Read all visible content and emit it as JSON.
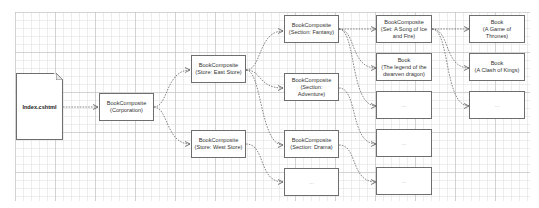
{
  "diagram": {
    "type": "flowchart",
    "nodes": {
      "index": {
        "label": "Index.cshtml",
        "shape": "document"
      },
      "corporation": {
        "label": "BookComposite\n(Corporation)"
      },
      "east_store": {
        "label": "BookComposite\n(Store: East Store)"
      },
      "west_store": {
        "label": "BookComposite\n(Store: West Store)"
      },
      "fantasy": {
        "label": "BookComposite\n(Section: Fantasy)"
      },
      "adventure": {
        "label": "BookComposite\n(Section: Adventure)"
      },
      "drama": {
        "label": "BookComposite\n(Section: Drama)"
      },
      "west_more": {
        "label": "..."
      },
      "song_set": {
        "label": "BookComposite\n(Set: A Song of Ice\nand Fire)"
      },
      "legend_book": {
        "label": "Book\n(The legend of the\ndwarven dragon)"
      },
      "fantasy_more": {
        "label": "..."
      },
      "adventure_more": {
        "label": "..."
      },
      "drama_more": {
        "label": "..."
      },
      "got_book": {
        "label": "Book\n(A Game of Thrones)"
      },
      "clash_book": {
        "label": "Book\n(A Clash of Kings)"
      },
      "set_more": {
        "label": "..."
      }
    },
    "edges": [
      [
        "index",
        "corporation"
      ],
      [
        "corporation",
        "east_store"
      ],
      [
        "corporation",
        "west_store"
      ],
      [
        "east_store",
        "fantasy"
      ],
      [
        "east_store",
        "adventure"
      ],
      [
        "east_store",
        "drama"
      ],
      [
        "west_store",
        "west_more"
      ],
      [
        "fantasy",
        "song_set"
      ],
      [
        "fantasy",
        "legend_book"
      ],
      [
        "fantasy",
        "fantasy_more"
      ],
      [
        "adventure",
        "adventure_more"
      ],
      [
        "drama",
        "drama_more"
      ],
      [
        "song_set",
        "got_book"
      ],
      [
        "song_set",
        "clash_book"
      ],
      [
        "song_set",
        "set_more"
      ]
    ],
    "colors": {
      "stroke": "#6e6e6e",
      "edge": "#555555",
      "grid": "#d0d0d0",
      "background": "#ffffff"
    }
  }
}
